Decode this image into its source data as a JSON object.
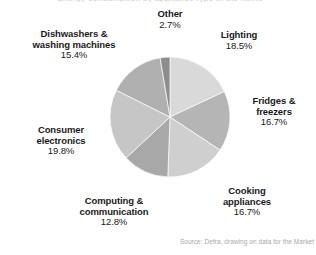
{
  "figure": {
    "clipped_title": "Energy consumption by appliance type in the home",
    "source": "Source: Defra, drawing on data for the Market"
  },
  "chart_data": {
    "type": "pie",
    "title": "",
    "xlabel": "",
    "ylabel": "",
    "unit": "%",
    "center": {
      "x": 170,
      "y": 117
    },
    "radius": 60,
    "start_angle_deg": 0,
    "direction": "clockwise",
    "legend": "none (direct labels)",
    "grid": false,
    "categories": [
      "Lighting",
      "Fridges & freezers",
      "Cooking appliances",
      "Computing & communication",
      "Consumer electronics",
      "Dishwashers & washing machines",
      "Other"
    ],
    "values": [
      18.5,
      16.7,
      16.7,
      12.8,
      19.8,
      15.4,
      2.7
    ],
    "slices": [
      {
        "label": "Lighting",
        "value": 18.5,
        "pct_text": "18.5%",
        "color": "#d9d9d9",
        "start_deg": 0,
        "sweep_deg": 66.6
      },
      {
        "label": "Fridges & freezers",
        "value": 16.7,
        "pct_text": "16.7%",
        "color": "#b5b5b5",
        "start_deg": 66.6,
        "sweep_deg": 60.12
      },
      {
        "label": "Cooking appliances",
        "value": 16.7,
        "pct_text": "16.7%",
        "color": "#cfcfcf",
        "start_deg": 126.72,
        "sweep_deg": 60.12
      },
      {
        "label": "Computing & communication",
        "value": 12.8,
        "pct_text": "12.8%",
        "color": "#a8a8a8",
        "start_deg": 186.84,
        "sweep_deg": 46.08
      },
      {
        "label": "Consumer electronics",
        "value": 19.8,
        "pct_text": "19.8%",
        "color": "#c6c6c6",
        "start_deg": 232.92,
        "sweep_deg": 71.28
      },
      {
        "label": "Dishwashers & washing machines",
        "value": 15.4,
        "pct_text": "15.4%",
        "color": "#b0b0b0",
        "start_deg": 304.2,
        "sweep_deg": 55.44
      },
      {
        "label": "Other",
        "value": 2.7,
        "pct_text": "2.7%",
        "color": "#8d8d8d",
        "start_deg": 359.64,
        "sweep_deg": 9.72
      }
    ]
  },
  "labels": {
    "other": {
      "name": "Other",
      "pct": "2.7%"
    },
    "lighting": {
      "name": "Lighting",
      "pct": "18.5%"
    },
    "fridges": {
      "name_line1": "Fridges &",
      "name_line2": "freezers",
      "pct": "16.7%"
    },
    "cooking": {
      "name_line1": "Cooking",
      "name_line2": "appliances",
      "pct": "16.7%"
    },
    "computing": {
      "name_line1": "Computing &",
      "name_line2": "communication",
      "pct": "12.8%"
    },
    "consumer": {
      "name_line1": "Consumer",
      "name_line2": "electronics",
      "pct": "19.8%"
    },
    "dishwashers": {
      "name_line1": "Dishwashers &",
      "name_line2": "washing machines",
      "pct": "15.4%"
    }
  }
}
